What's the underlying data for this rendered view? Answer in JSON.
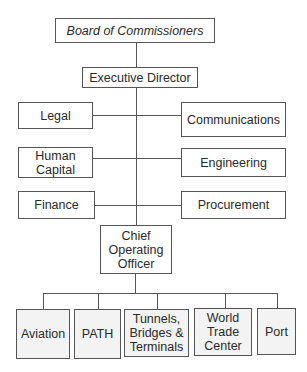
{
  "chart_title": "",
  "colors": {
    "border": "#555555",
    "box_fill": "#ffffff",
    "unit_fill": "#f3f3f3",
    "text": "#2a2a2a"
  },
  "nodes": {
    "board": "Board of Commissioners",
    "executive_director": "Executive Director",
    "legal": "Legal",
    "communications": "Communications",
    "human_capital": "Human\nCapital",
    "engineering": "Engineering",
    "finance": "Finance",
    "procurement": "Procurement",
    "coo": "Chief\nOperating\nOfficer",
    "units": [
      "Aviation",
      "PATH",
      "Tunnels,\nBridges &\nTerminals",
      "World\nTrade\nCenter",
      "Port"
    ]
  },
  "hierarchy": {
    "root": "Board of Commissioners",
    "children": [
      {
        "name": "Executive Director",
        "staff_left": [
          "Legal",
          "Human Capital",
          "Finance"
        ],
        "staff_right": [
          "Communications",
          "Engineering",
          "Procurement"
        ],
        "children": [
          {
            "name": "Chief Operating Officer",
            "children": [
              "Aviation",
              "PATH",
              "Tunnels, Bridges & Terminals",
              "World Trade Center",
              "Port"
            ]
          }
        ]
      }
    ]
  }
}
